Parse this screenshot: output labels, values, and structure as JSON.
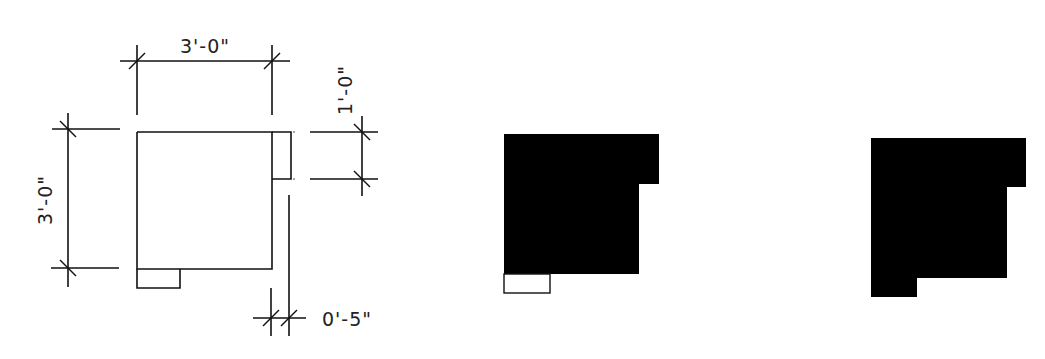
{
  "figures": {
    "dimensioned_plan": {
      "dimensions": {
        "top_width": "3'-0\"",
        "left_height": "3'-0\"",
        "notch_height": "1'-0\"",
        "offset": "0'-5\""
      }
    },
    "solid_with_open_tab": {
      "fill_color": "#000000",
      "tab_style": "outline"
    },
    "solid_merged": {
      "fill_color": "#000000"
    }
  }
}
